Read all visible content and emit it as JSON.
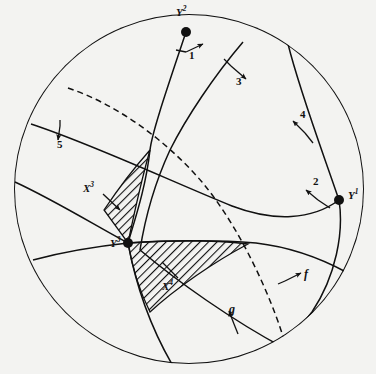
{
  "figure": {
    "type": "spherical-great-circle-diagram",
    "background_color": "#f3f3f1",
    "stroke_color": "#111111",
    "hatch_color": "#111111",
    "outer_circle": {
      "cx": 189,
      "cy": 189,
      "r": 175
    }
  },
  "points": [
    {
      "id": "Y2",
      "label": "Y",
      "superscript": "2",
      "x": 186,
      "y": 32,
      "label_x": 176,
      "label_y": 9
    },
    {
      "id": "Y1",
      "label": "Y",
      "superscript": "1",
      "x": 339,
      "y": 200,
      "label_x": 348,
      "label_y": 191
    },
    {
      "id": "Y3",
      "label": "Y",
      "superscript": "3",
      "x": 128,
      "y": 243,
      "label_x": 113,
      "label_y": 238
    }
  ],
  "region_labels": [
    {
      "id": "X3",
      "label": "X",
      "superscript": "3",
      "x": 88,
      "y": 189
    },
    {
      "id": "X4",
      "label": "X",
      "superscript": "4",
      "x": 167,
      "y": 285
    }
  ],
  "arrow_labels": [
    {
      "id": "1",
      "text": "1",
      "x": 190,
      "y": 55,
      "style": "number"
    },
    {
      "id": "2",
      "text": "2",
      "x": 314,
      "y": 181,
      "style": "number"
    },
    {
      "id": "3",
      "text": "3",
      "x": 237,
      "y": 81,
      "style": "number"
    },
    {
      "id": "4",
      "text": "4",
      "x": 301,
      "y": 114,
      "style": "number"
    },
    {
      "id": "5",
      "text": "5",
      "x": 57,
      "y": 142,
      "style": "number"
    },
    {
      "id": "f",
      "text": "f",
      "x": 305,
      "y": 274,
      "style": "italic"
    },
    {
      "id": "g",
      "text": "g",
      "x": 230,
      "y": 308,
      "style": "italic"
    }
  ],
  "curves": [
    {
      "id": "arc-a",
      "desc": "great circle through Y2 descending to lower-left rim",
      "dashed": false
    },
    {
      "id": "arc-b",
      "desc": "great circle from upper rim through center to Y1 region",
      "dashed": false
    },
    {
      "id": "arc-c",
      "desc": "great circle sweeping from left rim to right-lower rim",
      "dashed": false
    },
    {
      "id": "arc-d",
      "desc": "great circle from upper-left rim to lower-right rim",
      "dashed": false
    },
    {
      "id": "arc-e",
      "desc": "great circle passing Y1 down to lower rim",
      "dashed": false
    },
    {
      "id": "arc-dashed",
      "desc": "dashed great circle from upper-left rim to lower rim",
      "dashed": true
    }
  ],
  "shaded_regions": [
    {
      "id": "X3-region",
      "fill": "hatch-45",
      "desc": "narrow curvilinear triangle above vertex Y3"
    },
    {
      "id": "X4-region",
      "fill": "hatch-45",
      "desc": "wide curvilinear triangle right of vertex Y3"
    }
  ]
}
